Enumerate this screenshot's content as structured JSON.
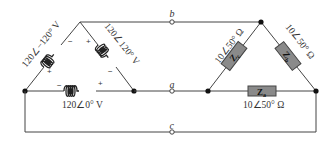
{
  "diagram": {
    "type": "three-phase delta-delta circuit",
    "source": {
      "configuration": "delta",
      "windings": [
        {
          "id": "left",
          "label": "120∠−120° V",
          "polarity_top": "−",
          "polarity_bottom": "+"
        },
        {
          "id": "right",
          "label": "120∠120° V",
          "polarity_top": "+",
          "polarity_bottom": "−"
        },
        {
          "id": "bottom",
          "label": "120∠0° V",
          "polarity_left": "−",
          "polarity_right": "+"
        }
      ]
    },
    "lines": [
      {
        "terminal": "b"
      },
      {
        "terminal": "a"
      },
      {
        "terminal": "c"
      }
    ],
    "load": {
      "configuration": "delta",
      "impedances": [
        {
          "name": "Zc",
          "main": "Z",
          "sub": "c",
          "value": "10∠50° Ω"
        },
        {
          "name": "Zb",
          "main": "Z",
          "sub": "b",
          "value": "10∠50° Ω"
        },
        {
          "name": "Za",
          "main": "Z",
          "sub": "a",
          "value": "10∠50° Ω"
        }
      ]
    }
  }
}
